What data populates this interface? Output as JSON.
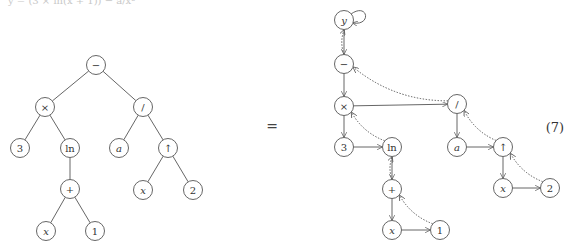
{
  "top_fragment": "y = (3 × ln(x + 1)) − a/x²",
  "equals_sign": "=",
  "equation_number": "(7)",
  "tree": {
    "title": "expression tree",
    "nodes": [
      {
        "id": "minus",
        "label": "−",
        "x": 96,
        "y": 65,
        "italic": false
      },
      {
        "id": "times",
        "label": "×",
        "x": 45,
        "y": 107,
        "italic": false
      },
      {
        "id": "div",
        "label": "/",
        "x": 143,
        "y": 107,
        "italic": false
      },
      {
        "id": "three",
        "label": "3",
        "x": 20,
        "y": 148,
        "italic": false
      },
      {
        "id": "ln",
        "label": "ln",
        "x": 70,
        "y": 148,
        "italic": false
      },
      {
        "id": "a",
        "label": "a",
        "x": 119,
        "y": 148,
        "italic": true
      },
      {
        "id": "pow",
        "label": "↑",
        "x": 168,
        "y": 148,
        "italic": false
      },
      {
        "id": "plus",
        "label": "+",
        "x": 70,
        "y": 189,
        "italic": false
      },
      {
        "id": "x2",
        "label": "x",
        "x": 143,
        "y": 190,
        "italic": true
      },
      {
        "id": "two",
        "label": "2",
        "x": 193,
        "y": 190,
        "italic": false
      },
      {
        "id": "x1",
        "label": "x",
        "x": 46,
        "y": 231,
        "italic": true
      },
      {
        "id": "one",
        "label": "1",
        "x": 95,
        "y": 231,
        "italic": false
      }
    ],
    "edges": [
      [
        "minus",
        "times"
      ],
      [
        "minus",
        "div"
      ],
      [
        "times",
        "three"
      ],
      [
        "times",
        "ln"
      ],
      [
        "div",
        "a"
      ],
      [
        "div",
        "pow"
      ],
      [
        "ln",
        "plus"
      ],
      [
        "pow",
        "x2"
      ],
      [
        "pow",
        "two"
      ],
      [
        "plus",
        "x1"
      ],
      [
        "plus",
        "one"
      ]
    ]
  },
  "graph": {
    "title": "linked instruction graph",
    "nodes": [
      {
        "id": "y",
        "label": "y",
        "x": 344,
        "y": 20,
        "italic": true
      },
      {
        "id": "minus",
        "label": "−",
        "x": 344,
        "y": 64,
        "italic": false
      },
      {
        "id": "times",
        "label": "×",
        "x": 344,
        "y": 106,
        "italic": false
      },
      {
        "id": "div",
        "label": "/",
        "x": 457,
        "y": 104,
        "italic": false
      },
      {
        "id": "three",
        "label": "3",
        "x": 344,
        "y": 147,
        "italic": false
      },
      {
        "id": "ln",
        "label": "ln",
        "x": 392,
        "y": 147,
        "italic": false
      },
      {
        "id": "a",
        "label": "a",
        "x": 457,
        "y": 147,
        "italic": true
      },
      {
        "id": "pow",
        "label": "↑",
        "x": 503,
        "y": 147,
        "italic": false
      },
      {
        "id": "plus",
        "label": "+",
        "x": 392,
        "y": 189,
        "italic": false
      },
      {
        "id": "x2",
        "label": "x",
        "x": 503,
        "y": 188,
        "italic": true
      },
      {
        "id": "two",
        "label": "2",
        "x": 550,
        "y": 188,
        "italic": false
      },
      {
        "id": "x1",
        "label": "x",
        "x": 392,
        "y": 230,
        "italic": true
      },
      {
        "id": "one",
        "label": "1",
        "x": 440,
        "y": 230,
        "italic": false
      }
    ],
    "solid_edges": [
      [
        "y",
        "minus"
      ],
      [
        "minus",
        "times"
      ],
      [
        "times",
        "div"
      ],
      [
        "times",
        "three"
      ],
      [
        "three",
        "ln"
      ],
      [
        "ln",
        "plus"
      ],
      [
        "plus",
        "x1"
      ],
      [
        "x1",
        "one"
      ],
      [
        "div",
        "a"
      ],
      [
        "a",
        "pow"
      ],
      [
        "pow",
        "x2"
      ],
      [
        "x2",
        "two"
      ]
    ],
    "dotted_edges": [
      [
        "minus",
        "y"
      ],
      [
        "div",
        "minus"
      ],
      [
        "ln",
        "times"
      ],
      [
        "plus",
        "ln"
      ],
      [
        "one",
        "plus"
      ],
      [
        "pow",
        "div"
      ],
      [
        "two",
        "pow"
      ]
    ],
    "self_loop": "y"
  }
}
